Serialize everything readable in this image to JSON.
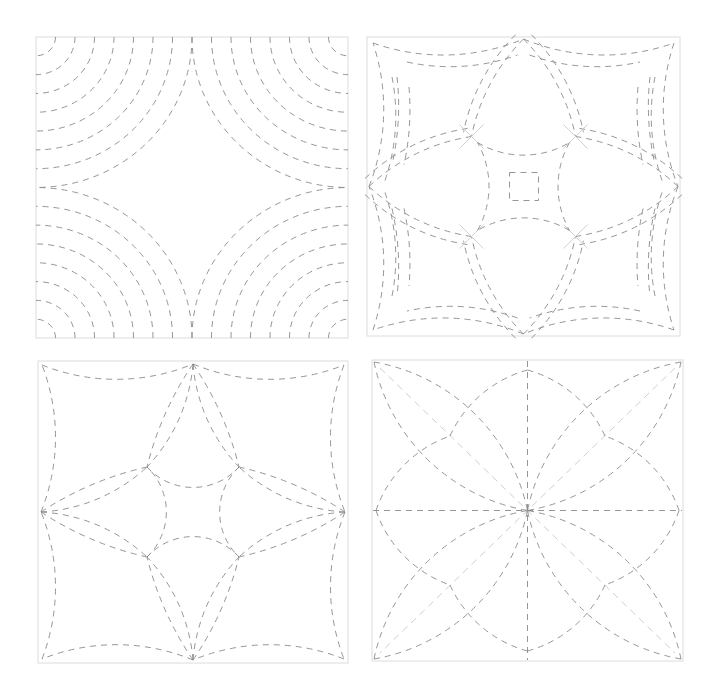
{
  "figure": {
    "description": "Four quilting stitch pattern blocks with dashed stitch lines",
    "colors": {
      "background": "#ffffff",
      "border": "#dcdcdc",
      "stitch": "#8a8a8a",
      "stitch_light": "#cfcfcf"
    },
    "blocks": [
      {
        "id": "concentric-corner-arcs",
        "label": "Concentric corner arcs",
        "position": "top-left",
        "x": 36,
        "y": 37,
        "size": 312,
        "height": 301,
        "arc_count": 8
      },
      {
        "id": "spider-web-star",
        "label": "Double-line web star with center square",
        "position": "top-right",
        "x": 367,
        "y": 37,
        "size": 313,
        "height": 299
      },
      {
        "id": "four-circle-lens-star",
        "label": "Four-circle lens star",
        "position": "bottom-left",
        "x": 38,
        "y": 361,
        "size": 310,
        "height": 302
      },
      {
        "id": "leaf-star-with-diagonals",
        "label": "Leaf star with diagonal guides",
        "position": "bottom-right",
        "x": 372,
        "y": 360,
        "size": 311,
        "height": 301
      }
    ]
  }
}
